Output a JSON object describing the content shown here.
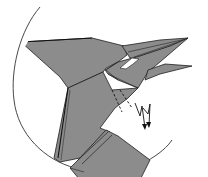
{
  "diagram": {
    "type": "origami-step",
    "colors": {
      "paper": "#8c8c8c",
      "paper_light": "#9a9a9a",
      "outline": "#1e1e1e",
      "background": "#ffffff",
      "circle": "#333333"
    },
    "elements": [
      {
        "name": "detail-circle",
        "description": "circular magnification outline clipping the model"
      },
      {
        "name": "upper-beak",
        "description": "long pointed upper beak flap pointing right"
      },
      {
        "name": "lower-beak",
        "description": "lower beak flap pointing right"
      },
      {
        "name": "crest",
        "description": "pointed crest extending to the left"
      },
      {
        "name": "eye-opening",
        "description": "small white triangular opening near the beak base"
      },
      {
        "name": "neck",
        "description": "long neck running down-left"
      },
      {
        "name": "dashed-fold-lines",
        "description": "two dashed valley-fold lines at the throat"
      },
      {
        "name": "sink-arrow",
        "description": "zigzag pleat arrow with double arrowheads pointing down"
      }
    ]
  }
}
